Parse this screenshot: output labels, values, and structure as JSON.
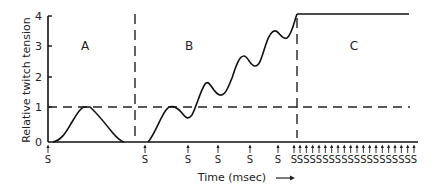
{
  "chart_data": {
    "type": "line",
    "title": "",
    "xlabel": "Time (msec)",
    "xlabel_arrow": "→",
    "ylabel": "Relative twitch tension",
    "ylim": [
      0,
      4
    ],
    "yticks": [
      "0",
      "1",
      "2",
      "3",
      "4"
    ],
    "grid": false,
    "reference_line": {
      "y": 1,
      "style": "dashed",
      "label": "single twitch tension"
    },
    "regions": [
      {
        "label": "A",
        "description": "single twitch",
        "stimuli": [
          "S"
        ],
        "curve": [
          [
            0,
            0
          ],
          [
            1,
            0.02
          ],
          [
            2,
            0.2
          ],
          [
            3,
            0.5
          ],
          [
            4,
            0.85
          ],
          [
            5,
            1.0
          ],
          [
            6,
            1.0
          ],
          [
            7,
            0.8
          ],
          [
            8,
            0.5
          ],
          [
            9,
            0.25
          ],
          [
            10,
            0.05
          ],
          [
            11,
            0
          ]
        ]
      },
      {
        "label": "B",
        "description": "summation (unfused tetanus)",
        "stimuli": [
          "S",
          "S",
          "S",
          "S",
          "S",
          "S"
        ],
        "curve": [
          [
            0,
            0
          ],
          [
            1,
            0.3
          ],
          [
            2,
            0.85
          ],
          [
            3,
            1.0
          ],
          [
            4,
            0.8
          ],
          [
            5,
            0.8
          ],
          [
            6,
            1.3
          ],
          [
            7,
            1.8
          ],
          [
            8,
            1.45
          ],
          [
            9,
            1.9
          ],
          [
            10,
            2.5
          ],
          [
            11,
            2.15
          ],
          [
            12,
            2.6
          ],
          [
            13,
            3.05
          ],
          [
            14,
            3.5
          ],
          [
            15,
            3.3
          ],
          [
            16,
            4.0
          ]
        ]
      },
      {
        "label": "C",
        "description": "fused tetanus",
        "stimuli": [
          "S",
          "S",
          "S",
          "S",
          "S",
          "S",
          "S",
          "S",
          "S",
          "S",
          "S",
          "S",
          "S",
          "S",
          "S",
          "S",
          "S",
          "S",
          "S"
        ],
        "curve": [
          [
            0,
            4.0
          ],
          [
            1,
            4.0
          ]
        ]
      }
    ]
  },
  "labels": {
    "region_a": "A",
    "region_b": "B",
    "region_c": "C",
    "stimulus": "S",
    "y0": "0",
    "y1": "1",
    "y2": "2",
    "y3": "3",
    "y4": "4",
    "ylabel": "Relative twitch tension",
    "xlabel": "Time (msec)"
  }
}
